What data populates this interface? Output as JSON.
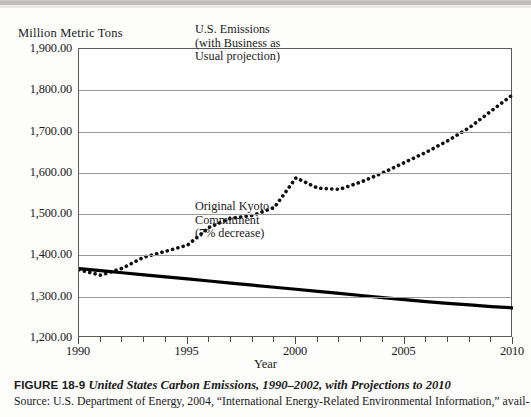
{
  "figure": {
    "axis_title_y": "Million Metric Tons",
    "axis_title_x": "Year",
    "caption_figure_number": "FIGURE 18-9",
    "caption_title": "United States Carbon Emissions, 1990–2002, with Projections to 2010",
    "caption_source": "Source: U.S. Department of Energy, 2004, “International Energy-Related Environmental Information,” avail-"
  },
  "annotations": {
    "emissions": [
      "U.S. Emissions",
      "(with Business as",
      "Usual projection)"
    ],
    "kyoto": [
      "Original Kyoto",
      "Commitment",
      "(7% decrease)"
    ]
  },
  "colors": {
    "series_emissions": "#111111",
    "series_kyoto": "#000000",
    "gridline": "#9a9a9a",
    "frame": "#5b5b5b",
    "page_background": "#fdfdfc"
  },
  "chart_data": {
    "type": "line",
    "title": "United States Carbon Emissions, 1990–2002, with Projections to 2010",
    "xlabel": "Year",
    "ylabel": "Million Metric Tons",
    "xlim": [
      1990,
      2010
    ],
    "ylim": [
      1200,
      1900
    ],
    "ytick_values": [
      1200,
      1300,
      1400,
      1500,
      1600,
      1700,
      1800,
      1900
    ],
    "ytick_labels": [
      "1,200.00",
      "1,300.00",
      "1,400.00",
      "1,500.00",
      "1,600.00",
      "1,700.00",
      "1,800.00",
      "1,900.00"
    ],
    "xtick_values": [
      1990,
      1991,
      1992,
      1993,
      1994,
      1995,
      1996,
      1997,
      1998,
      1999,
      2000,
      2001,
      2002,
      2003,
      2004,
      2005,
      2006,
      2007,
      2008,
      2009,
      2010
    ],
    "xtick_major": [
      1990,
      1995,
      2000,
      2005,
      2010
    ],
    "xtick_labels": [
      "1990",
      "1995",
      "2000",
      "2005",
      "2010"
    ],
    "grid": "horizontal",
    "legend_position": "inline-annotations",
    "series": [
      {
        "name": "U.S. Emissions (with Business as Usual projection)",
        "style": "dotted",
        "x": [
          1990,
          1991,
          1992,
          1993,
          1994,
          1995,
          1996,
          1997,
          1998,
          1999,
          2000,
          2001,
          2002,
          2003,
          2004,
          2005,
          2006,
          2007,
          2008,
          2009,
          2010
        ],
        "values": [
          1365,
          1352,
          1369,
          1396,
          1410,
          1425,
          1468,
          1490,
          1497,
          1516,
          1588,
          1563,
          1560,
          1578,
          1600,
          1625,
          1650,
          1678,
          1710,
          1750,
          1790
        ]
      },
      {
        "name": "Original Kyoto Commitment (7% decrease)",
        "style": "solid-thick",
        "x": [
          1990,
          1991,
          1992,
          1993,
          1994,
          1995,
          1996,
          1997,
          1998,
          1999,
          2000,
          2001,
          2002,
          2003,
          2004,
          2005,
          2006,
          2007,
          2008,
          2009,
          2010
        ],
        "values": [
          1368,
          1363,
          1358,
          1353,
          1348,
          1343,
          1338,
          1333,
          1328,
          1323,
          1318,
          1313,
          1308,
          1303,
          1298,
          1293,
          1288,
          1284,
          1280,
          1276,
          1273
        ]
      }
    ]
  }
}
